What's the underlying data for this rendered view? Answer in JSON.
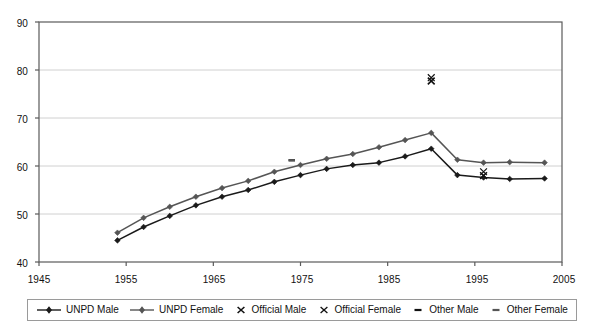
{
  "chart_data": {
    "type": "line",
    "title": "",
    "xlabel": "",
    "ylabel": "",
    "xlim": [
      1945,
      2005
    ],
    "ylim": [
      40,
      90
    ],
    "xticks": [
      1945,
      1955,
      1965,
      1975,
      1985,
      1995,
      2005
    ],
    "yticks": [
      40,
      50,
      60,
      70,
      80,
      90
    ],
    "grid": "horizontal",
    "legend_position": "bottom",
    "series": [
      {
        "name": "UNPD Male",
        "marker": "diamond",
        "style": "line+marker",
        "color": "#1a1a1a",
        "x": [
          1954,
          1957,
          1960,
          1963,
          1966,
          1969,
          1972,
          1975,
          1978,
          1981,
          1984,
          1987,
          1990,
          1993,
          1996,
          1999,
          2003
        ],
        "y": [
          44.5,
          47.3,
          49.6,
          51.8,
          53.6,
          55.0,
          56.7,
          58.1,
          59.4,
          60.2,
          60.7,
          62.0,
          63.6,
          58.1,
          57.6,
          57.3,
          57.4
        ]
      },
      {
        "name": "UNPD Female",
        "marker": "diamond",
        "style": "line+marker",
        "color": "#555555",
        "x": [
          1954,
          1957,
          1960,
          1963,
          1966,
          1969,
          1972,
          1975,
          1978,
          1981,
          1984,
          1987,
          1990,
          1993,
          1996,
          1999,
          2003
        ],
        "y": [
          46.1,
          49.2,
          51.5,
          53.6,
          55.4,
          56.9,
          58.8,
          60.2,
          61.5,
          62.5,
          63.9,
          65.4,
          66.9,
          61.3,
          60.7,
          60.8,
          60.7
        ]
      },
      {
        "name": "Official Male",
        "marker": "x",
        "style": "marker-only",
        "color": "#111111",
        "x": [
          1990,
          1996
        ],
        "y": [
          77.7,
          58.0
        ]
      },
      {
        "name": "Official Female",
        "marker": "x",
        "style": "marker-only",
        "color": "#111111",
        "x": [
          1990,
          1996
        ],
        "y": [
          78.4,
          58.8
        ]
      },
      {
        "name": "Other Male",
        "marker": "dash",
        "style": "marker-only",
        "color": "#111111",
        "x": [
          1974
        ],
        "y": [
          61.2
        ]
      },
      {
        "name": "Other Female",
        "marker": "dash",
        "style": "marker-only",
        "color": "#555555",
        "x": [
          1974
        ],
        "y": [
          61.2
        ]
      }
    ]
  },
  "axes": {
    "y_tick_labels": [
      "90",
      "80",
      "70",
      "60",
      "50",
      "40"
    ],
    "x_tick_labels": [
      "1945",
      "1955",
      "1965",
      "1975",
      "1985",
      "1995",
      "2005"
    ]
  },
  "legend": {
    "items": [
      {
        "label": "UNPD Male",
        "marker": "line-diamond",
        "color": "#1a1a1a"
      },
      {
        "label": "UNPD Female",
        "marker": "line-diamond",
        "color": "#555555"
      },
      {
        "label": "Official Male",
        "marker": "x",
        "color": "#111111"
      },
      {
        "label": "Official Female",
        "marker": "x",
        "color": "#111111"
      },
      {
        "label": "Other Male",
        "marker": "dash",
        "color": "#111111"
      },
      {
        "label": "Other Female",
        "marker": "dash",
        "color": "#555555"
      }
    ]
  },
  "colors": {
    "plot_border": "#5a5a5a",
    "gridline": "#d0d0d0",
    "background": "#ffffff",
    "text": "#111111"
  }
}
